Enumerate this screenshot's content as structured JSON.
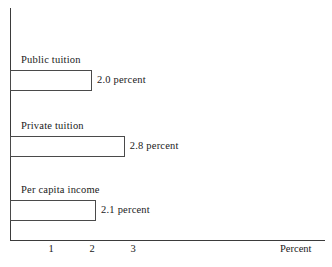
{
  "chart_data": {
    "type": "bar",
    "orientation": "horizontal",
    "title": "",
    "subtitle": "",
    "xlabel": "Percent",
    "ylabel": "",
    "categories": [
      "Public tuition",
      "Private tuition",
      "Per capita income"
    ],
    "values": [
      2.0,
      2.8,
      2.1
    ],
    "value_labels": [
      "2.0 percent",
      "2.8 percent",
      "2.1 percent"
    ],
    "xticks": [
      "1",
      "2",
      "3"
    ],
    "xtick_values": [
      1,
      2,
      3
    ],
    "xlim": [
      0,
      7.7
    ],
    "grid": false,
    "legend": "none",
    "bar_fill": "#ffffff",
    "bar_stroke": "#4a4a4a",
    "axis_color": "#3b3b3b",
    "background": "#ffffff"
  }
}
